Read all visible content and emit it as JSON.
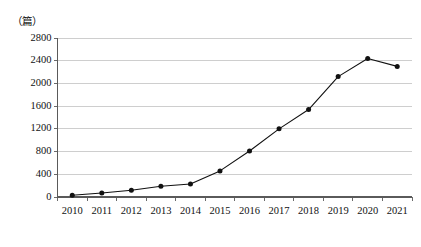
{
  "chart_data": {
    "type": "line",
    "title": "",
    "subtitle": "",
    "xlabel": "",
    "ylabel": "",
    "unit_label": "（篇）",
    "categories": [
      "2010",
      "2011",
      "2012",
      "2013",
      "2014",
      "2015",
      "2016",
      "2017",
      "2018",
      "2019",
      "2020",
      "2021"
    ],
    "values": [
      30,
      70,
      120,
      190,
      230,
      460,
      810,
      1200,
      1540,
      2120,
      2440,
      2300
    ],
    "series": [
      {
        "name": "",
        "values": [
          30,
          70,
          120,
          190,
          230,
          460,
          810,
          1200,
          1540,
          2120,
          2440,
          2300
        ]
      }
    ],
    "ylim": [
      0,
      2800
    ],
    "yticks": [
      0,
      400,
      800,
      1200,
      1600,
      2000,
      2400,
      2800
    ],
    "ytick_labels": [
      "0",
      "400",
      "800",
      "1200",
      "1600",
      "2000",
      "2400",
      "2800"
    ],
    "xtick_labels": [
      "2010",
      "2011",
      "2012",
      "2013",
      "2014",
      "2015",
      "2016",
      "2017",
      "2018",
      "2019",
      "2020",
      "2021"
    ],
    "grid": true,
    "grid_axis": "y",
    "legend": false,
    "legend_position": "none",
    "marker": "filled-circle",
    "line_color": "#111111",
    "marker_color": "#111111",
    "grid_color": "#b9b9b9",
    "axis_color": "#5a5a5a",
    "background_color": "#ffffff",
    "annotations": []
  }
}
